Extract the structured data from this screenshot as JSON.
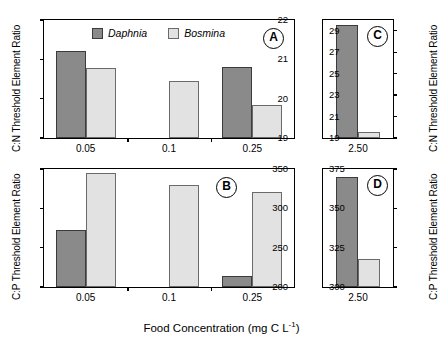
{
  "figure": {
    "xlabel": "Food Concentration (mg C L",
    "xlabel_sup": "-1",
    "xlabel_tail": ")",
    "colors": {
      "daphnia": "#8a8a8a",
      "bosmina": "#e2e2e2",
      "axis": "#000000"
    }
  },
  "legend": {
    "items": [
      {
        "label": "Daphnia",
        "key": "daphnia"
      },
      {
        "label": "Bosmina",
        "key": "bosmina"
      }
    ]
  },
  "chart_data": [
    {
      "type": "bar",
      "panel": "A",
      "title": "",
      "ylabel": "C:N Threshold Element Ratio",
      "xlabel": "",
      "categories": [
        "0.05",
        "0.1",
        "0.25"
      ],
      "yticks": [
        19,
        20,
        21,
        22
      ],
      "ylim": [
        19,
        22
      ],
      "grid": false,
      "legend_position": "top-center",
      "series": [
        {
          "name": "Daphnia",
          "values": [
            21.2,
            null,
            20.8
          ]
        },
        {
          "name": "Bosmina",
          "values": [
            20.77,
            20.45,
            19.83
          ]
        }
      ]
    },
    {
      "type": "bar",
      "panel": "C",
      "title": "",
      "ylabel": "C:N Threshold Element Ratio",
      "xlabel": "",
      "categories": [
        "2.50"
      ],
      "yticks": [
        19,
        21,
        23,
        25,
        27,
        29
      ],
      "ylim": [
        19,
        30
      ],
      "grid": false,
      "legend_position": "none",
      "series": [
        {
          "name": "Daphnia",
          "values": [
            29.5
          ]
        },
        {
          "name": "Bosmina",
          "values": [
            19.6
          ]
        }
      ]
    },
    {
      "type": "bar",
      "panel": "B",
      "title": "",
      "ylabel": "C:P Threshold Element Ratio",
      "xlabel": "Food Concentration (mg C L-1)",
      "categories": [
        "0.05",
        "0.1",
        "0.25"
      ],
      "yticks": [
        200,
        250,
        300,
        350
      ],
      "ylim": [
        200,
        350
      ],
      "grid": false,
      "legend_position": "none",
      "series": [
        {
          "name": "Daphnia",
          "values": [
            272,
            null,
            214
          ]
        },
        {
          "name": "Bosmina",
          "values": [
            345,
            330,
            321
          ]
        }
      ]
    },
    {
      "type": "bar",
      "panel": "D",
      "title": "",
      "ylabel": "C:P Threshold Element Ratio",
      "xlabel": "Food Concentration (mg C L-1)",
      "categories": [
        "2.50"
      ],
      "yticks": [
        300,
        325,
        350,
        375
      ],
      "ylim": [
        300,
        375
      ],
      "grid": false,
      "legend_position": "none",
      "series": [
        {
          "name": "Daphnia",
          "values": [
            370
          ]
        },
        {
          "name": "Bosmina",
          "values": [
            318
          ]
        }
      ]
    }
  ]
}
